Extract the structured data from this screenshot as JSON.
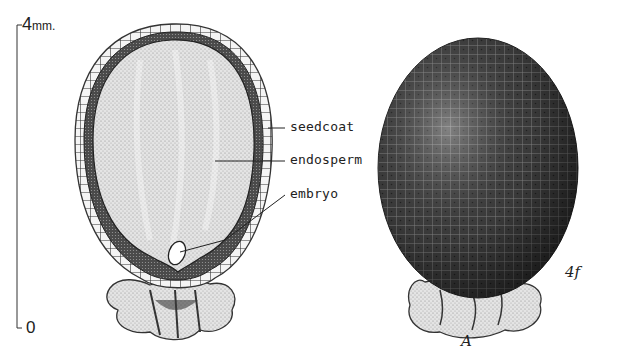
{
  "scale_bar": {
    "top_value": "4",
    "top_unit": "mm.",
    "bottom_value": "0"
  },
  "section_view": {
    "labels": [
      {
        "id": "seedcoat",
        "text": "seedcoat"
      },
      {
        "id": "endosperm",
        "text": "endosperm"
      },
      {
        "id": "embryo",
        "text": "embryo"
      }
    ]
  },
  "external_view": {
    "view_letter": "A",
    "artist_initials": "4f"
  },
  "colors": {
    "ink": "#1a1a1a",
    "background": "#ffffff",
    "endosperm_fill": "#d9d9d9",
    "seedcoat_fill": "#6e6e6e",
    "seed_surface": "#3a3a3a"
  }
}
